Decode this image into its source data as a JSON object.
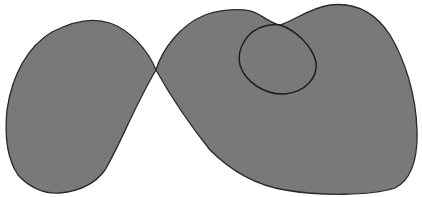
{
  "diagram": {
    "title": "",
    "background": "#ffffff",
    "fill_color": "#797979",
    "stroke_color": "#2a2a2a",
    "shapes": [
      {
        "id": "left-blob",
        "type": "filled-region",
        "label": ""
      },
      {
        "id": "right-blob",
        "type": "filled-region",
        "label": ""
      },
      {
        "id": "inner-circle",
        "type": "outline-loop",
        "label": ""
      }
    ],
    "crossing_point": {
      "x": 156,
      "y": 70
    }
  }
}
